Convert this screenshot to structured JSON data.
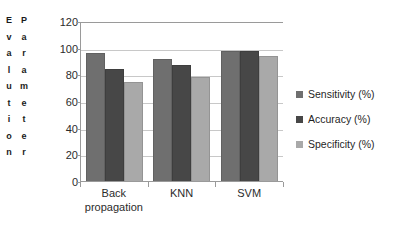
{
  "chart_data": {
    "type": "bar",
    "title": "",
    "xlabel": "",
    "ylabel": "Evalution Parameter",
    "ylabel_words": [
      "Evalution",
      "Parameter"
    ],
    "categories": [
      "Back propagation",
      "KNN",
      "SVM"
    ],
    "category_lines": [
      [
        "Back",
        "propagation"
      ],
      [
        "KNN"
      ],
      [
        "SVM"
      ]
    ],
    "series": [
      {
        "name": "Sensitivity (%)",
        "values": [
          97,
          92,
          98
        ],
        "color": "#6f6f6f"
      },
      {
        "name": "Accuracy (%)",
        "values": [
          85,
          87.5,
          98
        ],
        "color": "#474747"
      },
      {
        "name": "Specificity (%)",
        "values": [
          75,
          79,
          94.5
        ],
        "color": "#a9a9a9"
      }
    ],
    "ylim": [
      0,
      120
    ],
    "yticks": [
      120,
      100,
      80,
      60,
      40,
      20,
      0
    ],
    "grid": true,
    "legend_position": "right",
    "plot_background": "#ffffff",
    "gridline_color": "#c8c8c8",
    "axis_color": "#9a9a9a"
  }
}
